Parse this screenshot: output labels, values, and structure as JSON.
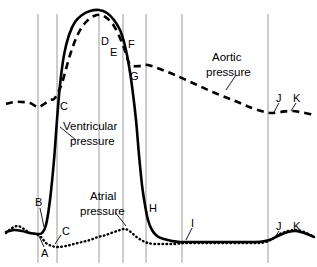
{
  "figure": {
    "title": "",
    "background": "#ffffff",
    "width": 317,
    "height": 267
  },
  "series_labels": {
    "aortic_line1": "Aortic",
    "aortic_line2": "pressure",
    "ventricular_line1": "Ventricular",
    "ventricular_line2": "pressure",
    "atrial_line1": "Atrial",
    "atrial_line2": "pressure"
  },
  "point_labels": {
    "A": "A",
    "B": "B",
    "C_vent": "C",
    "C_atrial": "C",
    "D": "D",
    "E": "E",
    "F": "F",
    "G": "G",
    "H": "H",
    "I": "I",
    "J_aortic": "J",
    "K_aortic": "K",
    "J_atrial": "J",
    "K_atrial": "K"
  },
  "colors": {
    "curve": "#000000",
    "gridline": "#9a9a9a",
    "background": "#ffffff"
  },
  "chart_data": {
    "type": "line",
    "xlabel": "",
    "ylabel": "",
    "grid": true,
    "gridlines_x": [
      38,
      57,
      99,
      123,
      146,
      182,
      268
    ],
    "legend": "inline-annotations",
    "xlim": [
      0,
      317
    ],
    "ylim": [
      267,
      0
    ],
    "series": [
      {
        "name": "Aortic pressure",
        "style": "dashed",
        "points": [
          [
            6,
            104
          ],
          [
            14,
            102
          ],
          [
            22,
            102
          ],
          [
            30,
            103
          ],
          [
            38,
            107
          ],
          [
            44,
            104
          ],
          [
            50,
            100
          ],
          [
            55,
            98
          ],
          [
            62,
            83
          ],
          [
            70,
            55
          ],
          [
            78,
            34
          ],
          [
            86,
            22
          ],
          [
            94,
            16
          ],
          [
            101,
            15
          ],
          [
            108,
            19
          ],
          [
            114,
            26
          ],
          [
            120,
            38
          ],
          [
            124,
            48
          ],
          [
            127,
            57
          ],
          [
            129,
            63
          ],
          [
            133,
            66
          ],
          [
            140,
            66
          ],
          [
            148,
            65
          ],
          [
            160,
            69
          ],
          [
            175,
            75
          ],
          [
            195,
            84
          ],
          [
            215,
            93
          ],
          [
            235,
            101
          ],
          [
            252,
            108
          ],
          [
            265,
            112
          ],
          [
            272,
            113
          ],
          [
            280,
            112
          ],
          [
            290,
            111
          ],
          [
            300,
            112
          ],
          [
            310,
            114
          ],
          [
            314,
            115
          ]
        ]
      },
      {
        "name": "Ventricular pressure",
        "style": "solid",
        "points": [
          [
            6,
            232
          ],
          [
            14,
            230
          ],
          [
            22,
            231
          ],
          [
            30,
            233
          ],
          [
            38,
            234
          ],
          [
            42,
            233
          ],
          [
            46,
            225
          ],
          [
            50,
            200
          ],
          [
            54,
            160
          ],
          [
            57,
            120
          ],
          [
            60,
            85
          ],
          [
            64,
            55
          ],
          [
            69,
            35
          ],
          [
            75,
            22
          ],
          [
            82,
            15
          ],
          [
            90,
            11
          ],
          [
            99,
            10
          ],
          [
            107,
            13
          ],
          [
            114,
            20
          ],
          [
            120,
            30
          ],
          [
            124,
            42
          ],
          [
            127,
            55
          ],
          [
            129,
            66
          ],
          [
            132,
            86
          ],
          [
            136,
            120
          ],
          [
            139,
            155
          ],
          [
            142,
            185
          ],
          [
            145,
            205
          ],
          [
            148,
            220
          ],
          [
            152,
            230
          ],
          [
            157,
            236
          ],
          [
            164,
            239
          ],
          [
            172,
            241
          ],
          [
            180,
            242
          ],
          [
            195,
            242
          ],
          [
            215,
            242
          ],
          [
            235,
            242
          ],
          [
            255,
            242
          ],
          [
            265,
            241
          ],
          [
            272,
            239
          ],
          [
            280,
            235
          ],
          [
            288,
            232
          ],
          [
            296,
            231
          ],
          [
            304,
            233
          ],
          [
            312,
            236
          ],
          [
            314,
            237
          ]
        ]
      },
      {
        "name": "Atrial pressure",
        "style": "dotted",
        "points": [
          [
            6,
            233
          ],
          [
            12,
            228
          ],
          [
            18,
            226
          ],
          [
            24,
            229
          ],
          [
            30,
            233
          ],
          [
            36,
            234
          ],
          [
            41,
            237
          ],
          [
            46,
            243
          ],
          [
            52,
            246
          ],
          [
            58,
            247
          ],
          [
            66,
            246
          ],
          [
            74,
            244
          ],
          [
            82,
            242
          ],
          [
            90,
            240
          ],
          [
            98,
            237
          ],
          [
            106,
            235
          ],
          [
            114,
            232
          ],
          [
            120,
            230
          ],
          [
            124,
            229
          ],
          [
            128,
            230
          ],
          [
            133,
            234
          ],
          [
            138,
            238
          ],
          [
            143,
            241
          ],
          [
            148,
            243
          ],
          [
            155,
            244
          ],
          [
            165,
            244
          ],
          [
            175,
            244
          ],
          [
            185,
            243
          ],
          [
            200,
            243
          ],
          [
            215,
            243
          ],
          [
            230,
            243
          ],
          [
            245,
            243
          ],
          [
            258,
            243
          ],
          [
            266,
            242
          ],
          [
            272,
            239
          ],
          [
            280,
            234
          ],
          [
            288,
            231
          ],
          [
            296,
            230
          ],
          [
            304,
            232
          ],
          [
            312,
            236
          ],
          [
            314,
            237
          ]
        ]
      }
    ],
    "annotations": [
      {
        "label": "A",
        "x": 44,
        "y": 251,
        "anchor_x": 39,
        "anchor_y": 238
      },
      {
        "label": "B",
        "x": 38,
        "y": 204,
        "anchor_x": 43,
        "anchor_y": 228
      },
      {
        "label": "C",
        "x": 62,
        "y": 105,
        "anchor_x": null,
        "anchor_y": null
      },
      {
        "label": "C",
        "x": 64,
        "y": 234,
        "anchor_x": 55,
        "anchor_y": 245
      },
      {
        "label": "D",
        "x": 104,
        "y": 43,
        "anchor_x": null,
        "anchor_y": null
      },
      {
        "label": "E",
        "x": 112,
        "y": 53,
        "anchor_x": null,
        "anchor_y": null
      },
      {
        "label": "F",
        "x": 130,
        "y": 46,
        "anchor_x": null,
        "anchor_y": null
      },
      {
        "label": "G",
        "x": 132,
        "y": 76,
        "anchor_x": null,
        "anchor_y": null
      },
      {
        "label": "H",
        "x": 151,
        "y": 208,
        "anchor_x": null,
        "anchor_y": null
      },
      {
        "label": "I",
        "x": 194,
        "y": 225,
        "anchor_x": 187,
        "anchor_y": 240
      },
      {
        "label": "J",
        "x": 280,
        "y": 100,
        "anchor_x": 275,
        "anchor_y": 112
      },
      {
        "label": "K",
        "x": 297,
        "y": 100,
        "anchor_x": 291,
        "anchor_y": 111
      },
      {
        "label": "J",
        "x": 280,
        "y": 228,
        "anchor_x": 275,
        "anchor_y": 239
      },
      {
        "label": "K",
        "x": 297,
        "y": 228,
        "anchor_x": 291,
        "anchor_y": 231
      }
    ]
  }
}
